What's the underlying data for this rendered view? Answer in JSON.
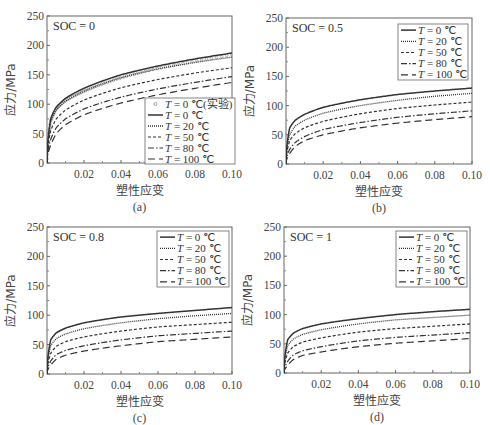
{
  "figure": {
    "y_axis_title": "应力/MPa",
    "x_axis_title": "塑性应变",
    "x_ticks": [
      "0.02",
      "0.04",
      "0.06",
      "0.08",
      "0.10"
    ],
    "y_ticks": [
      "0",
      "50",
      "100",
      "150",
      "200",
      "250"
    ],
    "legend_prefix": "T",
    "legend_entries": [
      {
        "label": "= 0 ℃",
        "style": "solid"
      },
      {
        "label": "= 20 ℃",
        "style": "dotted"
      },
      {
        "label": "= 50 ℃",
        "style": "short-dash"
      },
      {
        "label": "= 80 ℃",
        "style": "dash-dot"
      },
      {
        "label": "= 100 ℃",
        "style": "long-dash"
      }
    ],
    "experiment_legend": "= 0 ℃(实验)"
  },
  "chart_data": [
    {
      "type": "line",
      "panel": "(a)",
      "annotation": "SOC = 0",
      "xlabel": "塑性应变",
      "ylabel": "应力/MPa",
      "xlim": [
        0,
        0.1
      ],
      "ylim": [
        0,
        250
      ],
      "grid": false,
      "legend_position": "lower right",
      "x": [
        0,
        0.002,
        0.005,
        0.01,
        0.02,
        0.04,
        0.06,
        0.08,
        0.1
      ],
      "series": [
        {
          "name": "T = 0 ℃(实验)",
          "style": "markers",
          "values": [
            0,
            72,
            92,
            106,
            122,
            145,
            161,
            173,
            184
          ]
        },
        {
          "name": "T = 0 ℃",
          "style": "solid",
          "values": [
            0,
            75,
            95,
            110,
            127,
            150,
            165,
            177,
            187
          ]
        },
        {
          "name": "T = 20 ℃",
          "style": "dotted",
          "values": [
            0,
            70,
            90,
            105,
            122,
            145,
            160,
            171,
            180
          ]
        },
        {
          "name": "T = 50 ℃",
          "style": "short-dash",
          "values": [
            0,
            55,
            75,
            90,
            107,
            128,
            142,
            153,
            162
          ]
        },
        {
          "name": "T = 80 ℃",
          "style": "dash-dot",
          "values": [
            0,
            40,
            60,
            75,
            92,
            112,
            126,
            137,
            147
          ]
        },
        {
          "name": "T = 100 ℃",
          "style": "long-dash",
          "values": [
            0,
            30,
            50,
            65,
            82,
            102,
            116,
            127,
            137
          ]
        }
      ]
    },
    {
      "type": "line",
      "panel": "(b)",
      "annotation": "SOC = 0.5",
      "xlabel": "塑性应变",
      "ylabel": "应力/MPa",
      "xlim": [
        0,
        0.1
      ],
      "ylim": [
        0,
        250
      ],
      "grid": false,
      "legend_position": "upper right",
      "x": [
        0,
        0.002,
        0.005,
        0.01,
        0.02,
        0.04,
        0.06,
        0.08,
        0.1
      ],
      "series": [
        {
          "name": "T = 0 ℃",
          "style": "solid",
          "values": [
            0,
            62,
            75,
            85,
            97,
            110,
            119,
            125,
            130
          ]
        },
        {
          "name": "T = 20 ℃",
          "style": "dotted",
          "values": [
            0,
            50,
            65,
            75,
            87,
            100,
            109,
            116,
            121
          ]
        },
        {
          "name": "T = 50 ℃",
          "style": "short-dash",
          "values": [
            0,
            40,
            52,
            62,
            73,
            86,
            95,
            101,
            106
          ]
        },
        {
          "name": "T = 80 ℃",
          "style": "dash-dot",
          "values": [
            0,
            25,
            37,
            47,
            59,
            71,
            80,
            86,
            91
          ]
        },
        {
          "name": "T = 100 ℃",
          "style": "long-dash",
          "values": [
            0,
            18,
            30,
            40,
            50,
            62,
            70,
            76,
            81
          ]
        }
      ]
    },
    {
      "type": "line",
      "panel": "(c)",
      "annotation": "SOC = 0.8",
      "xlabel": "塑性应变",
      "ylabel": "应力/MPa",
      "xlim": [
        0,
        0.1
      ],
      "ylim": [
        0,
        250
      ],
      "grid": false,
      "legend_position": "upper right",
      "x": [
        0,
        0.002,
        0.005,
        0.01,
        0.02,
        0.04,
        0.06,
        0.08,
        0.1
      ],
      "series": [
        {
          "name": "T = 0 ℃",
          "style": "solid",
          "values": [
            0,
            58,
            70,
            78,
            87,
            97,
            103,
            108,
            113
          ]
        },
        {
          "name": "T = 20 ℃",
          "style": "dotted",
          "values": [
            0,
            48,
            60,
            68,
            77,
            87,
            94,
            99,
            103
          ]
        },
        {
          "name": "T = 50 ℃",
          "style": "short-dash",
          "values": [
            0,
            35,
            47,
            55,
            63,
            73,
            80,
            84,
            88
          ]
        },
        {
          "name": "T = 80 ℃",
          "style": "dash-dot",
          "values": [
            0,
            22,
            33,
            40,
            48,
            58,
            65,
            69,
            73
          ]
        },
        {
          "name": "T = 100 ℃",
          "style": "long-dash",
          "values": [
            0,
            15,
            25,
            32,
            39,
            48,
            55,
            59,
            63
          ]
        }
      ]
    },
    {
      "type": "line",
      "panel": "(d)",
      "annotation": "SOC = 1",
      "xlabel": "塑性应变",
      "ylabel": "应力/MPa",
      "xlim": [
        0,
        0.1
      ],
      "ylim": [
        0,
        250
      ],
      "grid": false,
      "legend_position": "upper right",
      "x": [
        0,
        0.002,
        0.005,
        0.01,
        0.02,
        0.04,
        0.06,
        0.08,
        0.1
      ],
      "series": [
        {
          "name": "T = 0 ℃",
          "style": "solid",
          "values": [
            0,
            57,
            68,
            76,
            84,
            93,
            100,
            105,
            109
          ]
        },
        {
          "name": "T = 20 ℃",
          "style": "dotted",
          "values": [
            0,
            47,
            58,
            66,
            74,
            84,
            91,
            95,
            99
          ]
        },
        {
          "name": "T = 50 ℃",
          "style": "short-dash",
          "values": [
            0,
            34,
            45,
            53,
            60,
            70,
            76,
            80,
            84
          ]
        },
        {
          "name": "T = 80 ℃",
          "style": "dash-dot",
          "values": [
            0,
            20,
            31,
            38,
            45,
            55,
            61,
            65,
            69
          ]
        },
        {
          "name": "T = 100 ℃",
          "style": "long-dash",
          "values": [
            0,
            13,
            23,
            30,
            36,
            45,
            51,
            55,
            59
          ]
        }
      ]
    }
  ]
}
